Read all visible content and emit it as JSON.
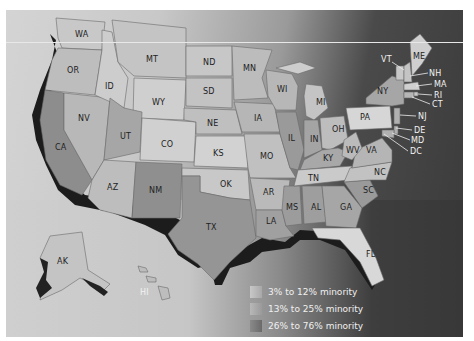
{
  "map": {
    "title": "",
    "states": [
      {
        "abbr": "WA",
        "x": 75,
        "y": 34,
        "category": 2
      },
      {
        "abbr": "OR",
        "x": 67,
        "y": 70,
        "category": 2
      },
      {
        "abbr": "CA",
        "x": 55,
        "y": 147,
        "category": 3
      },
      {
        "abbr": "NV",
        "x": 78,
        "y": 118,
        "category": 2
      },
      {
        "abbr": "ID",
        "x": 102,
        "y": 86,
        "category": 1
      },
      {
        "abbr": "MT",
        "x": 146,
        "y": 57,
        "category": 1
      },
      {
        "abbr": "WY",
        "x": 155,
        "y": 101,
        "category": 1
      },
      {
        "abbr": "UT",
        "x": 120,
        "y": 134,
        "category": 1
      },
      {
        "abbr": "AZ",
        "x": 107,
        "y": 185,
        "category": 2
      },
      {
        "abbr": "NM",
        "x": 150,
        "y": 189,
        "category": 3
      },
      {
        "abbr": "CO",
        "x": 160,
        "y": 142,
        "category": 1
      },
      {
        "abbr": "ND",
        "x": 201,
        "y": 62,
        "category": 1
      },
      {
        "abbr": "SD",
        "x": 201,
        "y": 91,
        "category": 1
      },
      {
        "abbr": "NE",
        "x": 207,
        "y": 122,
        "category": 1
      },
      {
        "abbr": "KS",
        "x": 214,
        "y": 151,
        "category": 1
      },
      {
        "abbr": "OK",
        "x": 222,
        "y": 183,
        "category": 2
      },
      {
        "abbr": "TX",
        "x": 206,
        "y": 226,
        "category": 3
      },
      {
        "abbr": "MN",
        "x": 245,
        "y": 67,
        "category": 1
      },
      {
        "abbr": "IA",
        "x": 256,
        "y": 117,
        "category": 1
      },
      {
        "abbr": "MO",
        "x": 262,
        "y": 154,
        "category": 2
      },
      {
        "abbr": "AR",
        "x": 264,
        "y": 190,
        "category": 2
      },
      {
        "abbr": "LA",
        "x": 267,
        "y": 219,
        "category": 3
      },
      {
        "abbr": "WI",
        "x": 278,
        "y": 88,
        "category": 1
      },
      {
        "abbr": "IL",
        "x": 288,
        "y": 137,
        "category": 2
      },
      {
        "abbr": "MS",
        "x": 287,
        "y": 205,
        "category": 3
      },
      {
        "abbr": "MI",
        "x": 317,
        "y": 101,
        "category": 2
      },
      {
        "abbr": "IN",
        "x": 311,
        "y": 138,
        "category": 1
      },
      {
        "abbr": "KY",
        "x": 324,
        "y": 157,
        "category": 1
      },
      {
        "abbr": "TN",
        "x": 311,
        "y": 176,
        "category": 2
      },
      {
        "abbr": "AL",
        "x": 312,
        "y": 205,
        "category": 3
      },
      {
        "abbr": "GA",
        "x": 341,
        "y": 205,
        "category": 3
      },
      {
        "abbr": "FL",
        "x": 368,
        "y": 252,
        "category": 2
      },
      {
        "abbr": "OH",
        "x": 334,
        "y": 127,
        "category": 2
      },
      {
        "abbr": "WV",
        "x": 347,
        "y": 148,
        "category": 1
      },
      {
        "abbr": "VA",
        "x": 369,
        "y": 149,
        "category": 2
      },
      {
        "abbr": "NC",
        "x": 376,
        "y": 170,
        "category": 2
      },
      {
        "abbr": "SC",
        "x": 366,
        "y": 189,
        "category": 3
      },
      {
        "abbr": "PA",
        "x": 362,
        "y": 116,
        "category": 1
      },
      {
        "abbr": "NY",
        "x": 380,
        "y": 90,
        "category": 2
      },
      {
        "abbr": "VT",
        "x": 383,
        "y": 59,
        "category": 1
      },
      {
        "abbr": "ME",
        "x": 414,
        "y": 54,
        "category": 1
      },
      {
        "abbr": "NH",
        "x": 428,
        "y": 72,
        "category": 1
      },
      {
        "abbr": "MA",
        "x": 433,
        "y": 84,
        "category": 1
      },
      {
        "abbr": "RI",
        "x": 433,
        "y": 95,
        "category": 1
      },
      {
        "abbr": "CT",
        "x": 432,
        "y": 104,
        "category": 2
      },
      {
        "abbr": "NJ",
        "x": 416,
        "y": 116,
        "category": 2
      },
      {
        "abbr": "DE",
        "x": 414,
        "y": 129,
        "category": 2
      },
      {
        "abbr": "MD",
        "x": 411,
        "y": 139,
        "category": 2
      },
      {
        "abbr": "DC",
        "x": 410,
        "y": 151,
        "category": 3
      },
      {
        "abbr": "AK",
        "x": 57,
        "y": 260,
        "category": 2
      },
      {
        "abbr": "HI",
        "x": 140,
        "y": 291,
        "category": 3
      }
    ]
  },
  "legend": {
    "items": [
      {
        "label": "3% to 12% minority",
        "color": "#b8b8b8"
      },
      {
        "label": "13% to 25% minority",
        "color": "#a8a8a8"
      },
      {
        "label": "26% to 76% minority",
        "color": "#7e7e7e"
      }
    ]
  },
  "colors": {
    "category_1": "#d8d8d8",
    "category_2": "#b4b4b4",
    "category_3": "#8a8a8a",
    "coast_shadow": "#1c1c1c",
    "ocean_dark": "#3b3b3b"
  }
}
